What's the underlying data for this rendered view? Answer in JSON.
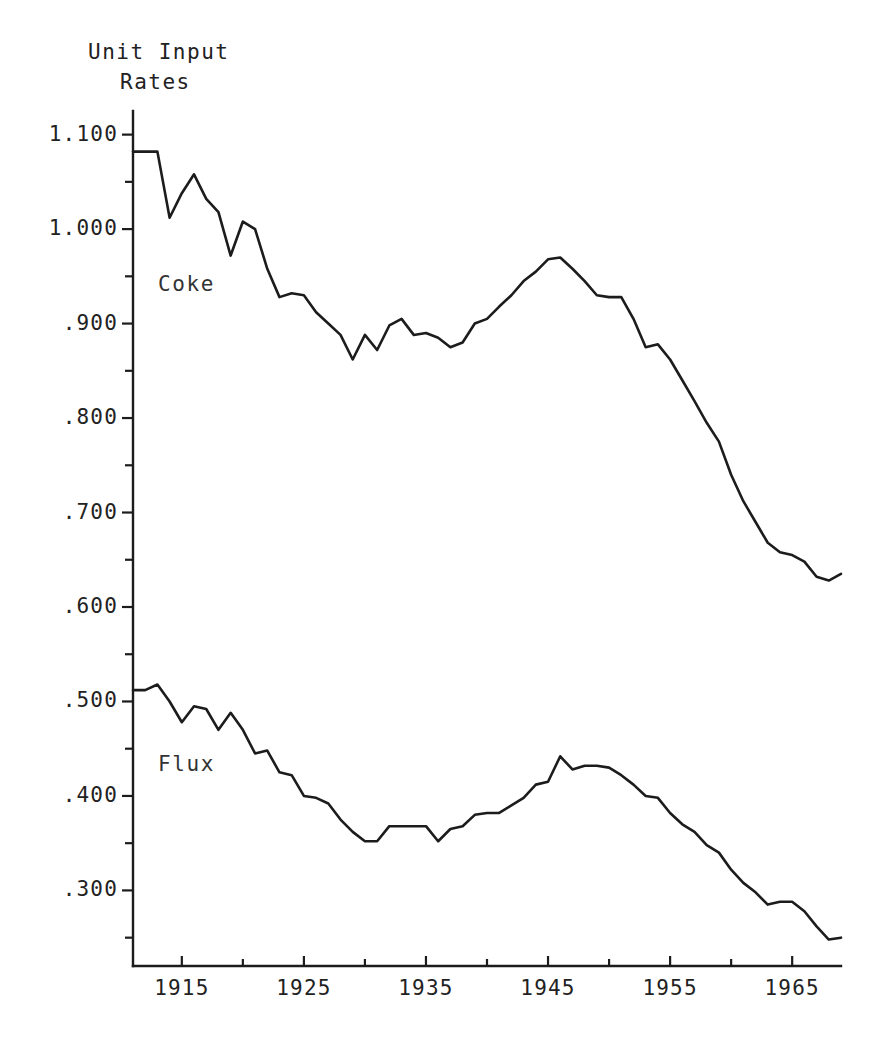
{
  "figure": {
    "title_line1": "Unit Input",
    "title_line2": "Rates",
    "background_color": "#ffffff",
    "ink_color": "#1c1c1c"
  },
  "axes": {
    "y_tick_labels": [
      "1.100",
      "1.000",
      ".900",
      ".800",
      ".700",
      ".600",
      ".500",
      ".400",
      ".300"
    ],
    "y_tick_values": [
      1.1,
      1.0,
      0.9,
      0.8,
      0.7,
      0.6,
      0.5,
      0.4,
      0.3
    ],
    "y_minor_step": 0.05,
    "x_tick_labels": [
      "1915",
      "1925",
      "1935",
      "1945",
      "1955",
      "1965"
    ],
    "x_tick_values": [
      1915,
      1925,
      1935,
      1945,
      1955,
      1965
    ],
    "x_minor_step": 5
  },
  "series_labels": {
    "coke": "Coke",
    "flux": "Flux"
  },
  "chart_data": {
    "type": "line",
    "title": "Unit Input Rates",
    "xlabel": "",
    "ylabel": "Unit Input Rates",
    "xlim": [
      1911,
      1969
    ],
    "ylim": [
      0.22,
      1.125
    ],
    "grid": false,
    "legend": "inline-annotations",
    "x": [
      1911,
      1912,
      1913,
      1914,
      1915,
      1916,
      1917,
      1918,
      1919,
      1920,
      1921,
      1922,
      1923,
      1924,
      1925,
      1926,
      1927,
      1928,
      1929,
      1930,
      1931,
      1932,
      1933,
      1934,
      1935,
      1936,
      1937,
      1938,
      1939,
      1940,
      1941,
      1942,
      1943,
      1944,
      1945,
      1946,
      1947,
      1948,
      1949,
      1950,
      1951,
      1952,
      1953,
      1954,
      1955,
      1956,
      1957,
      1958,
      1959,
      1960,
      1961,
      1962,
      1963,
      1964,
      1965,
      1966,
      1967,
      1968,
      1969
    ],
    "series": [
      {
        "name": "Coke",
        "values": [
          1.082,
          1.082,
          1.082,
          1.012,
          1.038,
          1.058,
          1.032,
          1.018,
          0.972,
          1.008,
          1.0,
          0.958,
          0.928,
          0.932,
          0.93,
          0.912,
          0.9,
          0.888,
          0.862,
          0.888,
          0.872,
          0.898,
          0.905,
          0.888,
          0.89,
          0.885,
          0.875,
          0.88,
          0.9,
          0.905,
          0.918,
          0.93,
          0.945,
          0.955,
          0.968,
          0.97,
          0.958,
          0.945,
          0.93,
          0.928,
          0.928,
          0.905,
          0.875,
          0.878,
          0.862,
          0.84,
          0.818,
          0.795,
          0.775,
          0.74,
          0.712,
          0.69,
          0.668,
          0.658,
          0.655,
          0.648,
          0.632,
          0.628,
          0.635
        ]
      },
      {
        "name": "Flux",
        "values": [
          0.512,
          0.512,
          0.518,
          0.5,
          0.478,
          0.495,
          0.492,
          0.47,
          0.488,
          0.47,
          0.445,
          0.448,
          0.425,
          0.422,
          0.4,
          0.398,
          0.392,
          0.375,
          0.362,
          0.352,
          0.352,
          0.368,
          0.368,
          0.368,
          0.368,
          0.352,
          0.365,
          0.368,
          0.38,
          0.382,
          0.382,
          0.39,
          0.398,
          0.412,
          0.415,
          0.442,
          0.428,
          0.432,
          0.432,
          0.43,
          0.422,
          0.412,
          0.4,
          0.398,
          0.382,
          0.37,
          0.362,
          0.348,
          0.34,
          0.322,
          0.308,
          0.298,
          0.285,
          0.288,
          0.288,
          0.278,
          0.262,
          0.248,
          0.25
        ]
      }
    ]
  }
}
